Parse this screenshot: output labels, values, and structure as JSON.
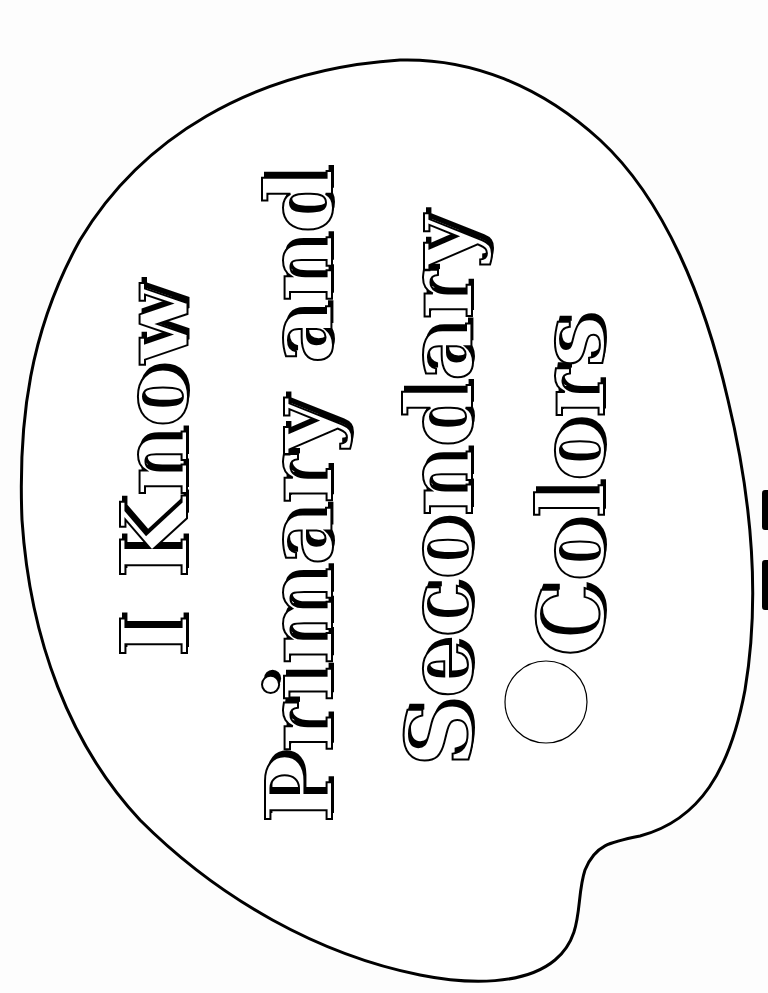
{
  "worksheet": {
    "title_lines": [
      {
        "text": "I Know"
      },
      {
        "text": "Primary and"
      },
      {
        "text": "Secondary"
      },
      {
        "text": "Colors"
      }
    ],
    "paint_well": {
      "fill": "#ffffff",
      "stroke": "#000000"
    },
    "palette": {
      "fill": "#ffffff",
      "stroke": "#000000"
    },
    "colors": {
      "ink": "#000000",
      "paper": "#fdfdfd"
    }
  }
}
